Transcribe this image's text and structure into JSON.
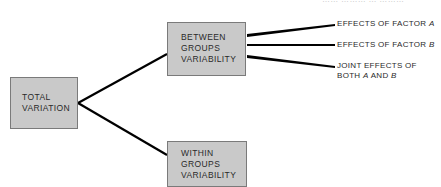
{
  "diagram": {
    "type": "tree",
    "header_fragment": "…… ……… … ………",
    "colors": {
      "box_fill": "#c9c9c9",
      "box_border": "#7a7a7a",
      "line": "#000000",
      "text": "#2a2a2a"
    },
    "root": {
      "lines": [
        "TOTAL",
        "VARIATION"
      ]
    },
    "branches": [
      {
        "lines": [
          "BETWEEN",
          "GROUPS",
          "VARIABILITY"
        ],
        "children": [
          {
            "text": "EFFECTS OF FACTOR ",
            "factor": "A"
          },
          {
            "text": "EFFECTS OF FACTOR ",
            "factor": "B"
          },
          {
            "line1": "JOINT EFFECTS OF",
            "line2_prefix": "BOTH ",
            "factor1": "A",
            "mid": " AND ",
            "factor2": "B"
          }
        ]
      },
      {
        "lines": [
          "WITHIN",
          "GROUPS",
          "VARIABILITY"
        ]
      }
    ]
  }
}
